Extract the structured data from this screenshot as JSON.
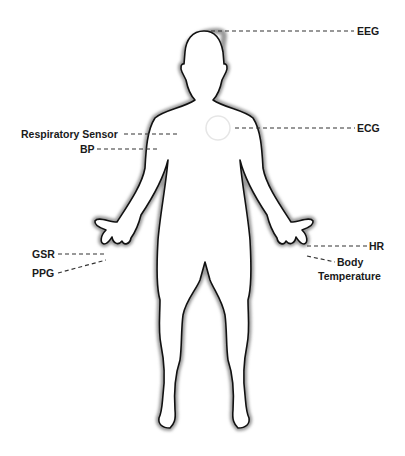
{
  "diagram": {
    "sensor_marker": "chest-circle",
    "colors": {
      "outline": "#111111",
      "halo": "#9a9a9a",
      "leader": "#333333",
      "text": "#1a1a1a"
    }
  },
  "labels": {
    "eeg": "EEG",
    "ecg": "ECG",
    "respiratory": "Respiratory Sensor",
    "bp": "BP",
    "gsr": "GSR",
    "ppg": "PPG",
    "hr": "HR",
    "body_temp_line1": "Body",
    "body_temp_line2": "Temperature"
  }
}
